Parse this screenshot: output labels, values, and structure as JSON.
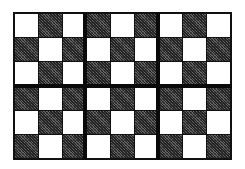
{
  "board": {
    "columns": 9,
    "rows": 6,
    "block_columns": 3,
    "block_rows": 3,
    "colors": {
      "light": "#ffffff",
      "dark": "#444444",
      "line": "#111111"
    },
    "pattern": [
      [
        "light",
        "dark",
        "light",
        "dark",
        "light",
        "dark",
        "light",
        "dark",
        "light"
      ],
      [
        "dark",
        "light",
        "dark",
        "light",
        "dark",
        "light",
        "dark",
        "light",
        "dark"
      ],
      [
        "light",
        "dark",
        "light",
        "dark",
        "light",
        "dark",
        "light",
        "dark",
        "light"
      ],
      [
        "dark",
        "light",
        "dark",
        "light",
        "dark",
        "light",
        "dark",
        "light",
        "dark"
      ],
      [
        "light",
        "dark",
        "light",
        "dark",
        "light",
        "dark",
        "light",
        "dark",
        "light"
      ],
      [
        "dark",
        "light",
        "dark",
        "light",
        "dark",
        "light",
        "dark",
        "light",
        "dark"
      ]
    ]
  }
}
